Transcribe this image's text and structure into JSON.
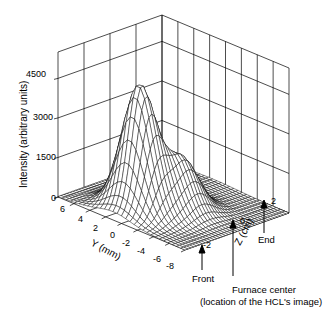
{
  "chart_data": {
    "type": "surface3d",
    "title": "",
    "zlabel": "Intensity (arbitrary units)",
    "ylabel": "Y (mm)",
    "xlabel": "Z (cm)",
    "z_ticks": [
      "0",
      "1500",
      "3000",
      "4500"
    ],
    "y_ticks": [
      "6",
      "4",
      "2",
      "0",
      "-2",
      "-4",
      "-6",
      "-8"
    ],
    "x_ticks": [
      "-2",
      "0",
      "2"
    ],
    "zlim": [
      0,
      5500
    ],
    "ylim": [
      -8,
      7
    ],
    "xlim": [
      -3,
      3
    ],
    "grid": true,
    "peak": {
      "y_mm": 0,
      "z_cm": -1.6,
      "intensity": 4600
    },
    "secondary_shoulder": {
      "y_mm": -2,
      "z_cm": -0.5,
      "intensity": 2000
    },
    "annotations": [
      {
        "label": "Front",
        "z_cm": -2
      },
      {
        "label": "Furnace center",
        "sublabel": "(location of the HCL's image)",
        "z_cm": 0
      },
      {
        "label": "End",
        "z_cm": 2
      }
    ]
  },
  "labels": {
    "zaxis": "Intensity (arbitrary units)",
    "yaxis": "Y (mm)",
    "xaxis": "Z (cm)",
    "z0": "0",
    "z1500": "1500",
    "z3000": "3000",
    "z4500": "4500",
    "y6": "6",
    "y4": "4",
    "y2": "2",
    "y0": "0",
    "yn2": "-2",
    "yn4": "-4",
    "yn6": "-6",
    "yn8": "-8",
    "xn2": "-2",
    "x0": "0",
    "x2": "2",
    "front": "Front",
    "end": "End",
    "center": "Furnace center",
    "center_sub": "(location of the HCL's image)"
  }
}
